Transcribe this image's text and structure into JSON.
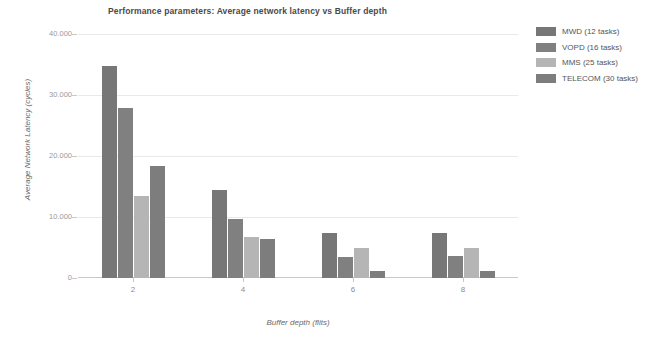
{
  "chart_data": {
    "type": "bar",
    "title": "Performance parameters: Average network latency vs Buffer depth",
    "xlabel": "Buffer depth (flits)",
    "ylabel": "Average Network Latency (cycles)",
    "categories": [
      "2",
      "4",
      "6",
      "8"
    ],
    "ylim": [
      0,
      40000
    ],
    "yticks": [
      0,
      10000,
      20000,
      30000,
      40000
    ],
    "ytick_labels": [
      "0",
      "10.000",
      "20.000",
      "30.000",
      "40.000"
    ],
    "grid": true,
    "legend_position": "right",
    "series": [
      {
        "name": "MWD (12 tasks)",
        "color": "#777777",
        "values": [
          34800,
          14400,
          7400,
          7400
        ]
      },
      {
        "name": "VOPD (16 tasks)",
        "color": "#808080",
        "values": [
          27900,
          9600,
          3400,
          3600
        ]
      },
      {
        "name": "MMS (25 tasks)",
        "color": "#b5b5b5",
        "values": [
          13500,
          6700,
          5000,
          5000
        ]
      },
      {
        "name": "TELECOM (30 tasks)",
        "color": "#7d7d7d",
        "values": [
          18400,
          6400,
          1200,
          1200
        ]
      }
    ]
  },
  "colors": {
    "background": "#ffffff",
    "gridline": "#e9e9e9",
    "axis": "#c8c8c8",
    "title_text": "#4a4a4a",
    "tick_text": "#9a9a9a",
    "axis_title_text": "#6a6a6a",
    "legend_text": "#555555"
  }
}
